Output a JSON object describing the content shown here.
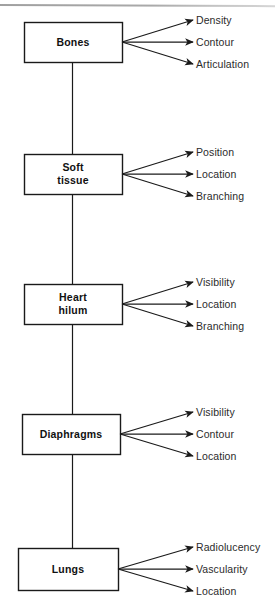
{
  "diagram": {
    "orientation": "vertical-spine-with-branches",
    "colors": {
      "background": "#ffffff",
      "stroke": "#1a1a1a",
      "node_text": "#111111",
      "attribute_text": "#2b2b2b"
    },
    "nodes": [
      {
        "id": "bones",
        "label": "Bones",
        "label_lines": "Bones",
        "box": {
          "x": 24,
          "y": 22,
          "w": 98,
          "h": 40
        },
        "attributes": [
          {
            "label": "Density"
          },
          {
            "label": "Contour"
          },
          {
            "label": "Articulation"
          }
        ]
      },
      {
        "id": "soft-tissue",
        "label": "Soft tissue",
        "label_lines": "Soft\ntissue",
        "box": {
          "x": 24,
          "y": 154,
          "w": 98,
          "h": 40
        },
        "attributes": [
          {
            "label": "Position"
          },
          {
            "label": "Location"
          },
          {
            "label": "Branching"
          }
        ]
      },
      {
        "id": "heart-hilum",
        "label": "Heart hilum",
        "label_lines": "Heart\nhilum",
        "box": {
          "x": 24,
          "y": 284,
          "w": 98,
          "h": 40
        },
        "attributes": [
          {
            "label": "Visibility"
          },
          {
            "label": "Location"
          },
          {
            "label": "Branching"
          }
        ]
      },
      {
        "id": "diaphragms",
        "label": "Diaphragms",
        "label_lines": "Diaphragms",
        "box": {
          "x": 22,
          "y": 414,
          "w": 98,
          "h": 40
        },
        "attributes": [
          {
            "label": "Visibility"
          },
          {
            "label": "Contour"
          },
          {
            "label": "Location"
          }
        ]
      },
      {
        "id": "lungs",
        "label": "Lungs",
        "label_lines": "Lungs",
        "box": {
          "x": 18,
          "y": 548,
          "w": 100,
          "h": 42
        },
        "attributes": [
          {
            "label": "Radiolucency"
          },
          {
            "label": "Vascularity"
          },
          {
            "label": "Location"
          }
        ]
      }
    ]
  }
}
